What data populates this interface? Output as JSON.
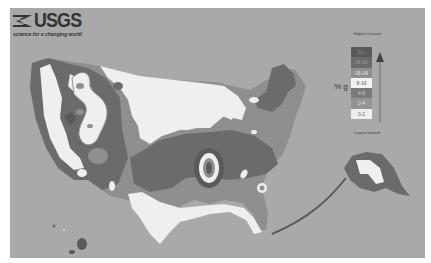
{
  "header": {
    "logo_text": "USGS",
    "tagline": "science for a changing world"
  },
  "legend": {
    "title_high": "Highest hazard",
    "title_low": "Lowest hazard",
    "unit": "% g",
    "arrow_icon": "up-arrow-icon",
    "bins": [
      {
        "label": "32+",
        "color": "#5a5a5a",
        "text_color": "#8a8a8a"
      },
      {
        "label": "24-32",
        "color": "#6b6b6b",
        "text_color": "#9a9a9a"
      },
      {
        "label": "16-24",
        "color": "#8f8f8f",
        "text_color": "#e8e8e8"
      },
      {
        "label": "8-16",
        "color": "#f2f2f2",
        "text_color": "#555555"
      },
      {
        "label": "4-8",
        "color": "#7a7a7a",
        "text_color": "#cfcfcf"
      },
      {
        "label": "2-4",
        "color": "#959595",
        "text_color": "#e0e0e0"
      },
      {
        "label": "0-2",
        "color": "#efefef",
        "text_color": "#666666"
      }
    ]
  },
  "map": {
    "subject": "Seismic hazard map of the United States (peak ground acceleration, % g)",
    "regions_shown": [
      "Contiguous United States",
      "Alaska",
      "Hawaii"
    ],
    "colors": {
      "background": "#a9a9a9",
      "low": "#efefef",
      "moderate": "#959595",
      "high": "#6b6b6b",
      "highest": "#5a5a5a"
    }
  }
}
